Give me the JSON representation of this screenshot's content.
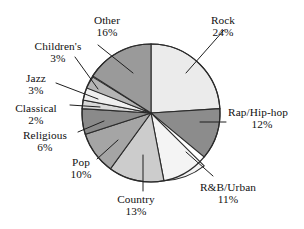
{
  "chart_data": {
    "type": "pie",
    "title": "",
    "subtitle": "",
    "xlabel": "",
    "ylabel": "",
    "legend_position": "none",
    "labels_position": "outside-with-leader-lines",
    "grid": false,
    "start_angle_deg": 0,
    "direction": "clockwise",
    "units": "percent",
    "categories": [
      "Rock",
      "Rap/Hip-hop",
      "R&B/Urban",
      "Country",
      "Pop",
      "Religious",
      "Classical",
      "Jazz",
      "Children's",
      "Other"
    ],
    "values": [
      24,
      12,
      11,
      13,
      10,
      6,
      2,
      3,
      3,
      16
    ],
    "total": 100,
    "slices": [
      {
        "label": "Rock",
        "value": 24,
        "value_text": "24%",
        "color": "#ebebeb",
        "start_deg": 0,
        "end_deg": 86.4
      },
      {
        "label": "Rap/Hip-hop",
        "value": 12,
        "value_text": "12%",
        "color": "#8c8c8c",
        "start_deg": 86.4,
        "end_deg": 129.6
      },
      {
        "label": "R&B/Urban",
        "value": 11,
        "value_text": "11%",
        "color": "#f4f4f4",
        "start_deg": 129.6,
        "end_deg": 169.2
      },
      {
        "label": "Country",
        "value": 13,
        "value_text": "13%",
        "color": "#cccccc",
        "start_deg": 169.2,
        "end_deg": 216.0
      },
      {
        "label": "Pop",
        "value": 10,
        "value_text": "10%",
        "color": "#a5a5a5",
        "start_deg": 216.0,
        "end_deg": 252.0
      },
      {
        "label": "Religious",
        "value": 6,
        "value_text": "6%",
        "color": "#8a8a8a",
        "start_deg": 252.0,
        "end_deg": 273.6
      },
      {
        "label": "Classical",
        "value": 2,
        "value_text": "2%",
        "color": "#d8d8d8",
        "start_deg": 273.6,
        "end_deg": 280.8
      },
      {
        "label": "Jazz",
        "value": 3,
        "value_text": "3%",
        "color": "#efefef",
        "start_deg": 280.8,
        "end_deg": 291.6
      },
      {
        "label": "Children's",
        "value": 3,
        "value_text": "3%",
        "color": "#b4b4b4",
        "start_deg": 291.6,
        "end_deg": 302.4
      },
      {
        "label": "Other",
        "value": 16,
        "value_text": "16%",
        "color": "#9a9a9a",
        "start_deg": 302.4,
        "end_deg": 360.0
      }
    ]
  },
  "figure": {
    "background": "#ffffff",
    "outline_color": "#2b2b2b",
    "leader_line_color": "#1f1f1f",
    "center_x": 151,
    "center_y": 113,
    "radius": 69
  },
  "labels": {
    "rock": {
      "name": "Rock",
      "pct": "24%"
    },
    "rap": {
      "name": "Rap/Hip-hop",
      "pct": "12%"
    },
    "rnb": {
      "name": "R&B/Urban",
      "pct": "11%"
    },
    "country": {
      "name": "Country",
      "pct": "13%"
    },
    "pop": {
      "name": "Pop",
      "pct": "10%"
    },
    "religious": {
      "name": "Religious",
      "pct": "6%"
    },
    "classical": {
      "name": "Classical",
      "pct": "2%"
    },
    "jazz": {
      "name": "Jazz",
      "pct": "3%"
    },
    "children": {
      "name": "Children's",
      "pct": "3%"
    },
    "other": {
      "name": "Other",
      "pct": "16%"
    }
  }
}
